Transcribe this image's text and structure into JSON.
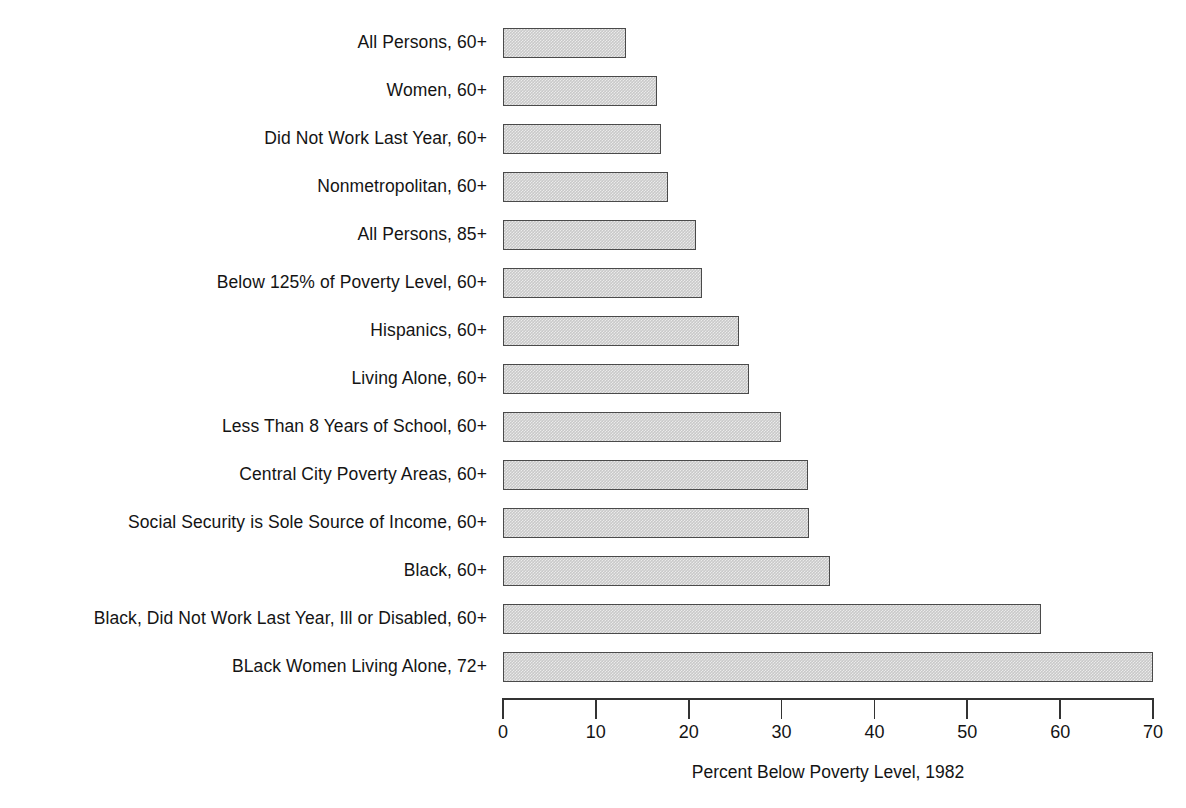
{
  "chart_data": {
    "type": "bar",
    "orientation": "horizontal",
    "title": "",
    "subtitle": "",
    "xlabel": "Percent Below Poverty Level, 1982",
    "ylabel": "",
    "xlim": [
      0,
      70
    ],
    "xticks": [
      0,
      10,
      20,
      30,
      40,
      50,
      60,
      70
    ],
    "xtick_labels": [
      "0",
      "10",
      "20",
      "30",
      "40",
      "50",
      "60",
      "70"
    ],
    "grid": false,
    "legend": false,
    "bar_fill_color": "#c9c9c9",
    "bar_border_color": "#4a4a4a",
    "axis_color": "#333333",
    "categories": [
      "All Persons, 60+",
      "Women, 60+",
      "Did Not Work Last Year, 60+",
      "Nonmetropolitan, 60+",
      "All Persons, 85+",
      "Below 125% of Poverty Level, 60+",
      "Hispanics, 60+",
      "Living Alone, 60+",
      "Less Than 8 Years of School, 60+",
      "Central City Poverty Areas, 60+",
      "Social Security is Sole Source of Income, 60+",
      "Black, 60+",
      "Black, Did Not Work Last Year, Ill or Disabled, 60+",
      "BLack Women Living Alone, 72+"
    ],
    "values": [
      13.2,
      16.6,
      17.0,
      17.8,
      20.8,
      21.4,
      25.4,
      26.5,
      29.9,
      32.8,
      33.0,
      35.2,
      57.9,
      70.0
    ]
  }
}
